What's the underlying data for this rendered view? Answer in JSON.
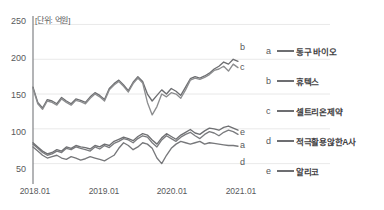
{
  "chart_data": {
    "type": "line",
    "title": "",
    "subtitle": "",
    "unit_note": "[단위: 억원]",
    "xlabel": "",
    "ylabel": "",
    "ylim": [
      25,
      255
    ],
    "yticks": [
      50,
      100,
      150,
      200,
      250
    ],
    "xticks": [
      "2018.01",
      "2019.01",
      "2020.01",
      "2021.01"
    ],
    "xlim": [
      "2018.01",
      "2021.06"
    ],
    "grid": "horizontal",
    "legend_position": "right",
    "axis_color": "#808285",
    "grid_color": "#e3e3e3",
    "series": [
      {
        "key": "a",
        "name": "동구 바이오",
        "color": "#7a7b7e",
        "end_label": "a",
        "end_value": 92,
        "values": [
          78,
          72,
          66,
          62,
          64,
          68,
          66,
          72,
          70,
          74,
          72,
          70,
          68,
          74,
          71,
          76,
          73,
          79,
          82,
          86,
          84,
          80,
          86,
          90,
          88,
          80,
          74,
          84,
          90,
          86,
          82,
          88,
          92,
          95,
          90,
          86,
          92,
          96,
          94,
          90,
          95,
          98,
          96,
          92
        ]
      },
      {
        "key": "b",
        "name": "휴텍스",
        "color": "#6d6e71",
        "end_label": "b",
        "end_value": 197,
        "values": [
          160,
          138,
          130,
          142,
          140,
          136,
          145,
          140,
          136,
          143,
          141,
          138,
          146,
          152,
          148,
          142,
          158,
          165,
          170,
          163,
          155,
          167,
          175,
          168,
          150,
          140,
          148,
          156,
          150,
          158,
          154,
          148,
          160,
          172,
          175,
          173,
          176,
          180,
          186,
          190,
          196,
          193,
          200,
          197
        ]
      },
      {
        "key": "c",
        "name": "셀트리온제약",
        "color": "#8c8d8f",
        "end_label": "c",
        "end_value": 188,
        "values": [
          158,
          136,
          128,
          140,
          138,
          134,
          143,
          138,
          134,
          141,
          139,
          136,
          144,
          150,
          146,
          140,
          156,
          163,
          168,
          161,
          153,
          165,
          173,
          166,
          138,
          120,
          132,
          150,
          146,
          152,
          150,
          144,
          156,
          170,
          173,
          171,
          174,
          178,
          184,
          186,
          190,
          183,
          193,
          188
        ]
      },
      {
        "key": "d",
        "name": "적극활용않한A사",
        "color": "#77787b",
        "end_label": "d",
        "end_value": 75,
        "values": [
          74,
          68,
          62,
          58,
          60,
          62,
          58,
          56,
          60,
          58,
          55,
          57,
          60,
          58,
          56,
          54,
          58,
          62,
          72,
          80,
          76,
          70,
          74,
          80,
          78,
          72,
          58,
          50,
          62,
          72,
          78,
          82,
          80,
          78,
          80,
          82,
          78,
          80,
          79,
          78,
          77,
          76,
          76,
          75
        ]
      },
      {
        "key": "e",
        "name": "알리코",
        "color": "#6f7073",
        "end_label": "e",
        "end_value": 98,
        "values": [
          80,
          74,
          68,
          64,
          66,
          70,
          68,
          74,
          72,
          76,
          74,
          73,
          71,
          76,
          74,
          78,
          76,
          82,
          85,
          88,
          86,
          83,
          89,
          93,
          91,
          84,
          78,
          87,
          93,
          89,
          85,
          91,
          95,
          99,
          94,
          92,
          97,
          101,
          100,
          98,
          102,
          104,
          101,
          98
        ]
      }
    ]
  },
  "axis": {
    "unit_note": "[단위: 억원]",
    "y_tick_labels": [
      "250",
      "200",
      "150",
      "100",
      "50"
    ],
    "x_tick_labels": [
      "2018.01",
      "2019.01",
      "2020.01",
      "2021.01"
    ]
  },
  "end_labels": [
    {
      "text": "b"
    },
    {
      "text": "c"
    },
    {
      "text": "e"
    },
    {
      "text": "a"
    },
    {
      "text": "d"
    }
  ],
  "legend": {
    "items": [
      {
        "key": "a",
        "label": "동구 바이오"
      },
      {
        "key": "b",
        "label": "휴텍스"
      },
      {
        "key": "c",
        "label": "셀트리온제약"
      },
      {
        "key": "d",
        "label": "적극활용않한A사"
      },
      {
        "key": "e",
        "label": "알리코"
      }
    ]
  }
}
